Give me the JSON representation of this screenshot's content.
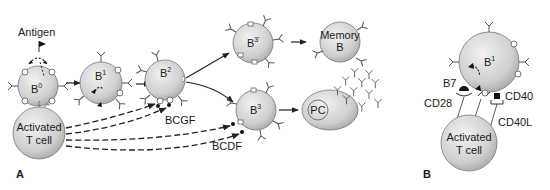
{
  "figure": {
    "panels": [
      {
        "id": "A",
        "label": "A"
      },
      {
        "id": "B",
        "label": "B"
      }
    ],
    "panel_a": {
      "antigen_label": "Antigen",
      "cells": {
        "b0": {
          "label": "B",
          "sup": "0"
        },
        "b1": {
          "label": "B",
          "sup": "1"
        },
        "b2": {
          "label": "B",
          "sup": "2"
        },
        "b3prime": {
          "label": "B",
          "sup": "3'"
        },
        "b3": {
          "label": "B",
          "sup": "3"
        },
        "memory": {
          "line1": "Memory",
          "line2": "B"
        },
        "plasma": {
          "label": "PC"
        },
        "tcell": {
          "line1": "Activated",
          "line2": "T cell"
        }
      },
      "factors": {
        "bcgf": "BCGF",
        "bcdf": "BCDF"
      }
    },
    "panel_b": {
      "cells": {
        "b1": {
          "label": "B",
          "sup": "1"
        },
        "tcell": {
          "line1": "Activated",
          "line2": "T cell"
        }
      },
      "molecules": {
        "b7": "B7",
        "cd28": "CD28",
        "cd40": "CD40",
        "cd40l": "CD40L"
      }
    },
    "colors": {
      "cell_fill_light": "#e6e6e6",
      "cell_fill_dark": "#b3b3b3",
      "stroke": "#333333"
    }
  }
}
